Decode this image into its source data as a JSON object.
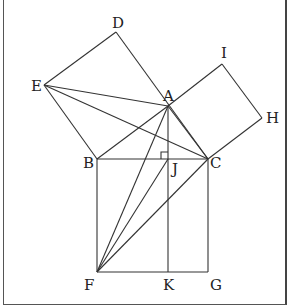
{
  "diagram": {
    "points": {
      "A": [
        168,
        106
      ],
      "B": [
        97,
        159
      ],
      "C": [
        208,
        159
      ],
      "D": [
        116,
        32
      ],
      "E": [
        44,
        85
      ],
      "I": [
        222,
        64
      ],
      "H": [
        262,
        118
      ],
      "F": [
        97,
        272
      ],
      "G": [
        208,
        272
      ],
      "J": [
        168,
        159
      ],
      "K": [
        168,
        272
      ]
    },
    "labels": [
      {
        "text": "D",
        "x": 112,
        "y": 28
      },
      {
        "text": "E",
        "x": 31,
        "y": 91
      },
      {
        "text": "A",
        "x": 163,
        "y": 101
      },
      {
        "text": "I",
        "x": 221,
        "y": 58
      },
      {
        "text": "H",
        "x": 266,
        "y": 123
      },
      {
        "text": "B",
        "x": 83,
        "y": 168
      },
      {
        "text": "J",
        "x": 172,
        "y": 174
      },
      {
        "text": "C",
        "x": 210,
        "y": 168
      },
      {
        "text": "F",
        "x": 84,
        "y": 290
      },
      {
        "text": "K",
        "x": 163,
        "y": 290
      },
      {
        "text": "G",
        "x": 210,
        "y": 290
      }
    ],
    "segments": [
      [
        "E",
        "D"
      ],
      [
        "D",
        "C"
      ],
      [
        "E",
        "B"
      ],
      [
        "E",
        "A"
      ],
      [
        "E",
        "C"
      ],
      [
        "A",
        "I"
      ],
      [
        "I",
        "H"
      ],
      [
        "H",
        "C"
      ],
      [
        "A",
        "B"
      ],
      [
        "A",
        "C"
      ],
      [
        "B",
        "C"
      ],
      [
        "B",
        "F"
      ],
      [
        "F",
        "G"
      ],
      [
        "G",
        "C"
      ],
      [
        "A",
        "K"
      ],
      [
        "F",
        "A"
      ],
      [
        "F",
        "J"
      ],
      [
        "F",
        "C"
      ]
    ],
    "right_angle_marker": {
      "at": "J",
      "size": 7
    },
    "line_color": "#333333"
  }
}
